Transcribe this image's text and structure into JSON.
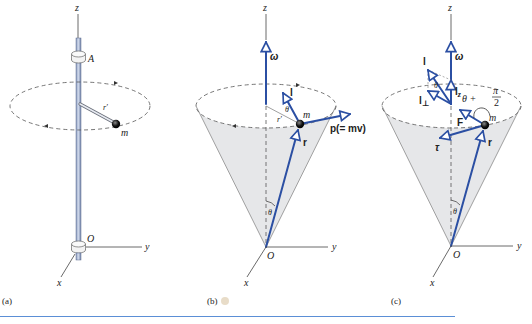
{
  "figure": {
    "colors": {
      "vector": "#2b4fa3",
      "rod": "#b7c4de",
      "rod_edge": "#5b6b8f",
      "cone_fill": "#e6e7e9",
      "cone_edge": "#8a8a8a",
      "rule": "#5b8fd6",
      "highlight_dot": "#e8dcc8"
    },
    "panels": [
      {
        "id": "a",
        "caption": "(a)",
        "labels": {
          "z": "z",
          "A": "A",
          "r_prime": "r′",
          "m": "m",
          "O": "O",
          "y": "y",
          "x": "x"
        }
      },
      {
        "id": "b",
        "caption": "(b)",
        "labels": {
          "z": "z",
          "omega": "ω",
          "l": "l",
          "theta_top": "θ",
          "r_prime": "r′",
          "m": "m",
          "p": "p(= mv)",
          "r": "r",
          "theta_apex": "θ",
          "O": "O",
          "y": "y",
          "x": "x"
        }
      },
      {
        "id": "c",
        "caption": "(c)",
        "labels": {
          "z": "z",
          "omega": "ω",
          "l": "l",
          "theta_top": "θ",
          "l_z": "l",
          "l_z_sub": "z",
          "l_perp": "l",
          "l_perp_sub": "⊥",
          "angle_theta": "θ +",
          "angle_pi": "π",
          "angle_2": "2",
          "F": "F",
          "m": "m",
          "tau": "τ",
          "r": "r",
          "theta_apex": "θ",
          "O": "O",
          "y": "y",
          "x": "x"
        }
      }
    ]
  }
}
